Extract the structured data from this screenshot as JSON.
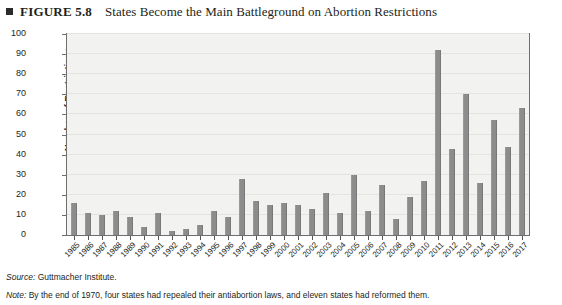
{
  "figure": {
    "label": "FIGURE 5.8",
    "title": "States Become the Main Battleground on Abortion Restrictions",
    "bullet_icon": "filled-square-icon"
  },
  "footnotes": {
    "source_prefix": "Source:",
    "source_text": " Guttmacher Institute.",
    "note_prefix": "Note:",
    "note_text": " By the end of 1970, four states had repealed their antiabortion laws, and eleven states had reformed them."
  },
  "colors": {
    "bar": "#8c8c8c",
    "plot_background": "#f2f2f1",
    "frame": "#6e6e6e",
    "gridline": "#e3e3e0",
    "text": "#231f20"
  },
  "chart_data": {
    "type": "bar",
    "title": "States Become the Main Battleground on Abortion Restrictions",
    "xlabel": "",
    "ylabel": "Number of Restrictions",
    "ylim": [
      0,
      100
    ],
    "yticks": [
      0,
      10,
      20,
      30,
      40,
      50,
      60,
      70,
      80,
      90,
      100
    ],
    "grid": true,
    "legend": "none",
    "categories": [
      "1985",
      "1986",
      "1987",
      "1988",
      "1989",
      "1990",
      "1991",
      "1992",
      "1993",
      "1994",
      "1995",
      "1996",
      "1997",
      "1998",
      "1999",
      "2000",
      "2001",
      "2002",
      "2003",
      "2004",
      "2005",
      "2006",
      "2007",
      "2008",
      "2009",
      "2010",
      "2011",
      "2012",
      "2013",
      "2014",
      "2015",
      "2016",
      "2017"
    ],
    "values": [
      16,
      11,
      10,
      12,
      9,
      4,
      11,
      2,
      3,
      5,
      12,
      9,
      28,
      17,
      15,
      16,
      15,
      13,
      21,
      11,
      30,
      12,
      25,
      8,
      19,
      27,
      92,
      43,
      70,
      26,
      57,
      44,
      63
    ]
  }
}
